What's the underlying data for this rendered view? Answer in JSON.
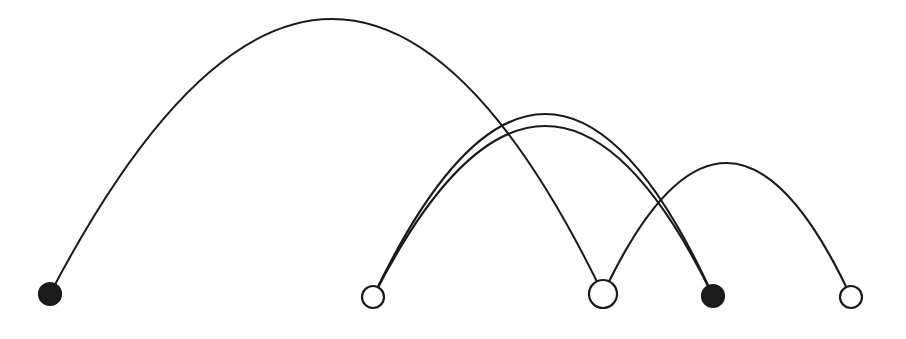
{
  "canvas": {
    "width": 906,
    "height": 339,
    "background_color": "#ffffff",
    "title": "Arc Diagram"
  },
  "style": {
    "stroke_color": "#1a1a1a",
    "fill_color": "#1a1a1a",
    "open_node_fill": "#ffffff",
    "edge_stroke_width": 2.1,
    "node_stroke_width": 2.2
  },
  "chart_data": {
    "type": "diagram",
    "subtype": "arc-diagram",
    "xlabel": "",
    "ylabel": "",
    "grid": false,
    "legend": "none",
    "baseline_y": 295,
    "nodes": [
      {
        "id": "n1",
        "label": "",
        "x": 50,
        "y": 294,
        "r": 11,
        "filled": true
      },
      {
        "id": "n2",
        "label": "",
        "x": 373,
        "y": 297,
        "r": 11,
        "filled": false
      },
      {
        "id": "n3",
        "label": "",
        "x": 603,
        "y": 294,
        "r": 14,
        "filled": false
      },
      {
        "id": "n4",
        "label": "",
        "x": 713,
        "y": 296,
        "r": 11,
        "filled": true
      },
      {
        "id": "n5",
        "label": "",
        "x": 851,
        "y": 297,
        "r": 11,
        "filled": false
      }
    ],
    "edges": [
      {
        "id": "e1",
        "source": "n1",
        "target": "n3",
        "apex_x": 332,
        "apex_y": 19,
        "stroke_width": 2.0
      },
      {
        "id": "e2",
        "source": "n2",
        "target": "n4",
        "apex_x": 545,
        "apex_y": 114,
        "stroke_width": 2.2
      },
      {
        "id": "e3",
        "source": "n2",
        "target": "n4",
        "apex_x": 545,
        "apex_y": 126,
        "stroke_width": 2.2
      },
      {
        "id": "e4",
        "source": "n3",
        "target": "n5",
        "apex_x": 727,
        "apex_y": 163,
        "stroke_width": 2.2
      }
    ],
    "node_count": 5,
    "edge_count": 4,
    "filled_node_count": 2,
    "open_node_count": 3
  }
}
